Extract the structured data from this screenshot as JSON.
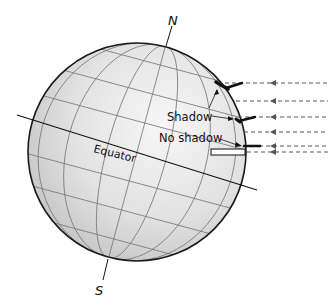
{
  "diagram": {
    "pole_north": "N",
    "pole_south": "S",
    "equator_label": "Equator",
    "shadow_label": "Shadow",
    "no_shadow_label": "No shadow",
    "colors": {
      "globe_fill_light": "#f4f4f4",
      "globe_fill_dark": "#c9c9c9",
      "outline": "#1a1a1a",
      "grid": "#777777",
      "rays": "#555555"
    },
    "sun_rays_count": 6
  }
}
